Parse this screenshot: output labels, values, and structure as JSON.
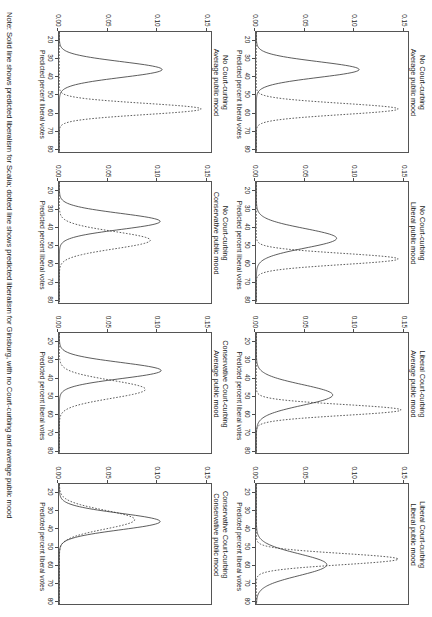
{
  "figure": {
    "note": "Note: Solid line shows predicted liberalism for Scalia; dotted line shows predicted liberalism for Ginsburg, with no Court-curbing and average public mood",
    "xlabel": "Predicted percent liberal votes",
    "xticks": [
      "20",
      "30",
      "40",
      "50",
      "60",
      "70",
      "80"
    ],
    "yticks": [
      "0.00",
      "0.05",
      "0.10",
      "0.15"
    ],
    "line_color": "#333333",
    "axis_color": "#555555"
  },
  "chart_data": {
    "type": "line",
    "title": "",
    "xlabel": "Predicted percent liberal votes",
    "ylabel": "",
    "xlim": [
      18,
      82
    ],
    "ylim": [
      0.0,
      0.155
    ],
    "xticks": [
      20,
      30,
      40,
      50,
      60,
      70,
      80
    ],
    "yticks": [
      0.0,
      0.05,
      0.1,
      0.15
    ],
    "grid": false,
    "legend": "none",
    "series_styles": [
      {
        "name": "Scalia",
        "style": "solid"
      },
      {
        "name": "Ginsburg",
        "style": "dotted"
      }
    ],
    "panels": [
      {
        "id": "p1",
        "title_line1": "No Court-curbing",
        "title_line2": "Average public mood",
        "row": 0,
        "col": 0,
        "series": [
          {
            "name": "Scalia",
            "style": "solid",
            "peak_x": 38,
            "peak_y": 0.105,
            "sd": 4.2
          },
          {
            "name": "Ginsburg",
            "style": "dotted",
            "peak_x": 59,
            "peak_y": 0.145,
            "sd": 3.0
          }
        ]
      },
      {
        "id": "p2",
        "title_line1": "No Court-curbing",
        "title_line2": "Liberal public mood",
        "row": 0,
        "col": 1,
        "series": [
          {
            "name": "Scalia",
            "style": "solid",
            "peak_x": 48,
            "peak_y": 0.082,
            "sd": 5.2
          },
          {
            "name": "Ginsburg",
            "style": "dotted",
            "peak_x": 59,
            "peak_y": 0.145,
            "sd": 3.0
          }
        ]
      },
      {
        "id": "p3",
        "title_line1": "Liberal Court-curbing",
        "title_line2": "Average public mood",
        "row": 0,
        "col": 2,
        "series": [
          {
            "name": "Scalia",
            "style": "solid",
            "peak_x": 51,
            "peak_y": 0.078,
            "sd": 5.5
          },
          {
            "name": "Ginsburg",
            "style": "dotted",
            "peak_x": 59,
            "peak_y": 0.148,
            "sd": 2.9
          }
        ]
      },
      {
        "id": "p4",
        "title_line1": "Liberal Court-curbing",
        "title_line2": "Liberal public mood",
        "row": 0,
        "col": 3,
        "series": [
          {
            "name": "Scalia",
            "style": "solid",
            "peak_x": 61,
            "peak_y": 0.072,
            "sd": 5.8
          },
          {
            "name": "Ginsburg",
            "style": "dotted",
            "peak_x": 58,
            "peak_y": 0.145,
            "sd": 3.0
          }
        ]
      },
      {
        "id": "p5",
        "title_line1": "No Court-curbing",
        "title_line2": "Average public mood",
        "row": 1,
        "col": 0,
        "series": [
          {
            "name": "Scalia",
            "style": "solid",
            "peak_x": 38,
            "peak_y": 0.105,
            "sd": 4.2
          },
          {
            "name": "Ginsburg",
            "style": "dotted",
            "peak_x": 59,
            "peak_y": 0.145,
            "sd": 3.0
          }
        ]
      },
      {
        "id": "p6",
        "title_line1": "No Court-curbing",
        "title_line2": "Conservative public mood",
        "row": 1,
        "col": 1,
        "series": [
          {
            "name": "Scalia",
            "style": "solid",
            "peak_x": 39,
            "peak_y": 0.103,
            "sd": 4.3
          },
          {
            "name": "Ginsburg",
            "style": "dotted",
            "peak_x": 49,
            "peak_y": 0.093,
            "sd": 4.6
          }
        ]
      },
      {
        "id": "p7",
        "title_line1": "Conservative Court-curbing",
        "title_line2": "Average public mood",
        "row": 1,
        "col": 2,
        "series": [
          {
            "name": "Scalia",
            "style": "solid",
            "peak_x": 38,
            "peak_y": 0.104,
            "sd": 4.3
          },
          {
            "name": "Ginsburg",
            "style": "dotted",
            "peak_x": 48,
            "peak_y": 0.088,
            "sd": 4.8
          }
        ]
      },
      {
        "id": "p8",
        "title_line1": "Conservative Court-curbing",
        "title_line2": "Conservative public mood",
        "row": 1,
        "col": 3,
        "series": [
          {
            "name": "Scalia",
            "style": "solid",
            "peak_x": 38,
            "peak_y": 0.103,
            "sd": 4.4
          },
          {
            "name": "Ginsburg",
            "style": "dotted",
            "peak_x": 37,
            "peak_y": 0.077,
            "sd": 5.0
          }
        ]
      }
    ]
  }
}
